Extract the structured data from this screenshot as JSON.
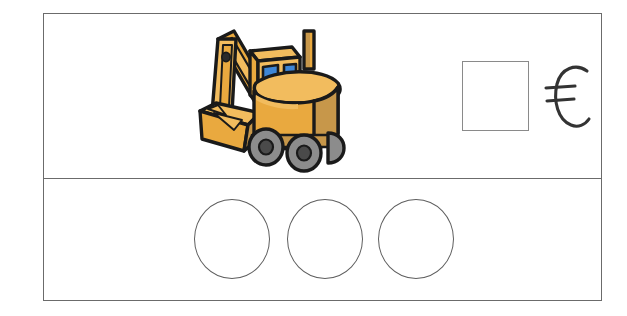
{
  "worksheet": {
    "title": "Coin payment worksheet",
    "rows": {
      "top": {
        "name": "item-and-price-row",
        "picture": {
          "icon": "excavator-icon",
          "label": "excavator",
          "colors": {
            "body_light": "#F2BC5E",
            "body_mid": "#E9A93F",
            "body_shadow": "#C7974A",
            "window_blue": "#3E86D6",
            "wheel_gray": "#8C8C8C",
            "hub_dark": "#4A4A4A",
            "outline": "#1A1A1A"
          }
        },
        "price_box": {
          "name": "price-input-box",
          "value": "",
          "placeholder": ""
        },
        "currency": {
          "name": "euro-sign",
          "symbol": "€",
          "label": "euro"
        }
      },
      "bottom": {
        "name": "coin-slots-row",
        "slots": [
          {
            "label": "",
            "value": ""
          },
          {
            "label": "",
            "value": ""
          },
          {
            "label": "",
            "value": ""
          }
        ],
        "slot_count": 3
      }
    },
    "colors": {
      "frame_border": "#6b6b6b",
      "box_border": "#8a8a8a",
      "circle_border": "#5e5e5e",
      "background": "#ffffff",
      "ink": "#333333"
    }
  }
}
